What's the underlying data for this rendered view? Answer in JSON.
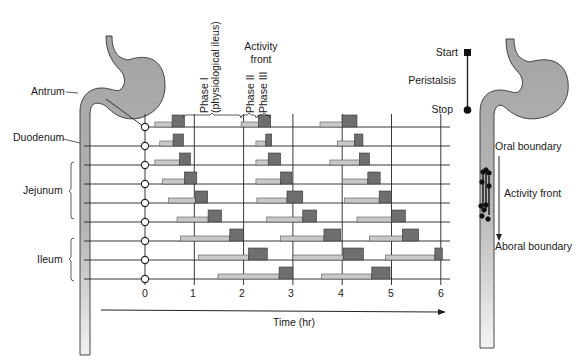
{
  "left_anatomy": {
    "labels": {
      "antrum": "Antrum",
      "duodenum": "Duodenum",
      "jejunum": "Jejunum",
      "ileum": "Ileum"
    }
  },
  "top_annotations": {
    "phase1_line1": "Phase I",
    "phase1_line2": "(physiological ileus)",
    "activity_front_line1": "Activity",
    "activity_front_line2": "front",
    "phase2": "Phase II",
    "phase3": "Phase III"
  },
  "axis": {
    "ticks": [
      "0",
      "1",
      "2",
      "3",
      "4",
      "5",
      "6"
    ],
    "label": "Time (hr)"
  },
  "legend": {
    "start": "Start",
    "peristalsis": "Peristalsis",
    "stop": "Stop"
  },
  "right_anatomy": {
    "oral_boundary": "Oral boundary",
    "activity_front": "Activity front",
    "aboral_boundary": "Aboral boundary"
  },
  "colors": {
    "phase2_bar": "#c8c8c8",
    "phase3_bar": "#6e6e6e",
    "gut_fill": "#a9a9a9",
    "line": "#222222"
  },
  "chart_data": {
    "type": "diagram-timeline",
    "xlabel": "Time (hr)",
    "xlim": [
      0,
      6
    ],
    "rows": [
      "Antrum",
      "Duodenum 1",
      "Duodenum 2",
      "Jejunum 1",
      "Jejunum 2",
      "Jejunum 3",
      "Jejunum 4 / Ileum 1",
      "Ileum 2",
      "Ileum 3"
    ],
    "complexes": [
      [
        {
          "phase2": [
            0.2,
            0.55
          ],
          "phase3": [
            0.55,
            0.8
          ]
        },
        {
          "phase2": [
            1.95,
            2.3
          ],
          "phase3": [
            2.3,
            2.55
          ]
        },
        {
          "phase2": [
            3.55,
            4.0
          ],
          "phase3": [
            4.0,
            4.3
          ]
        }
      ],
      [
        {
          "phase2": [
            0.3,
            0.57
          ],
          "phase3": [
            0.57,
            0.78
          ]
        },
        {
          "phase2": [
            2.25,
            2.45
          ],
          "phase3": [
            2.45,
            2.57
          ]
        },
        {
          "phase2": [
            3.9,
            4.25
          ],
          "phase3": [
            4.25,
            4.42
          ]
        }
      ],
      [
        {
          "phase2": [
            0.2,
            0.7
          ],
          "phase3": [
            0.7,
            0.92
          ]
        },
        {
          "phase2": [
            2.25,
            2.5
          ],
          "phase3": [
            2.5,
            2.75
          ]
        },
        {
          "phase2": [
            3.75,
            4.35
          ],
          "phase3": [
            4.35,
            4.55
          ]
        }
      ],
      [
        {
          "phase2": [
            0.35,
            0.8
          ],
          "phase3": [
            0.8,
            1.05
          ]
        },
        {
          "phase2": [
            2.25,
            2.75
          ],
          "phase3": [
            2.75,
            2.98
          ]
        },
        {
          "phase2": [
            4.0,
            4.52
          ],
          "phase3": [
            4.52,
            4.77
          ]
        }
      ],
      [
        {
          "phase2": [
            0.48,
            1.02
          ],
          "phase3": [
            1.02,
            1.27
          ]
        },
        {
          "phase2": [
            2.27,
            2.88
          ],
          "phase3": [
            2.88,
            3.2
          ]
        },
        {
          "phase2": [
            4.05,
            4.75
          ],
          "phase3": [
            4.75,
            5.0
          ]
        }
      ],
      [
        {
          "phase2": [
            0.65,
            1.28
          ],
          "phase3": [
            1.28,
            1.55
          ]
        },
        {
          "phase2": [
            2.47,
            3.2
          ],
          "phase3": [
            3.2,
            3.48
          ]
        },
        {
          "phase2": [
            4.3,
            5.0
          ],
          "phase3": [
            5.0,
            5.28
          ]
        }
      ],
      [
        {
          "phase2": [
            0.72,
            1.72
          ],
          "phase3": [
            1.72,
            2.0
          ]
        },
        {
          "phase2": [
            2.75,
            3.63
          ],
          "phase3": [
            3.63,
            3.97
          ]
        },
        {
          "phase2": [
            4.55,
            5.22
          ],
          "phase3": [
            5.22,
            5.55
          ]
        }
      ],
      [
        {
          "phase2": [
            1.08,
            2.1
          ],
          "phase3": [
            2.1,
            2.48
          ]
        },
        {
          "phase2": [
            3.0,
            4.02
          ],
          "phase3": [
            4.02,
            4.43
          ]
        },
        {
          "phase2": [
            4.88,
            5.88
          ],
          "phase3": [
            5.88,
            6.03
          ]
        }
      ],
      [
        {
          "phase2": [
            1.48,
            2.72
          ],
          "phase3": [
            2.72,
            3.0
          ]
        },
        {
          "phase2": [
            3.58,
            4.6
          ],
          "phase3": [
            4.6,
            4.97
          ]
        }
      ]
    ]
  }
}
